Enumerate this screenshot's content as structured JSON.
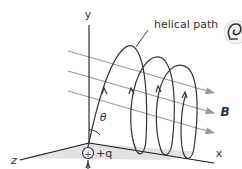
{
  "diagram": {
    "type": "physics-helical-motion",
    "labels": {
      "y_axis": "y",
      "x_axis": "x",
      "z_axis": "z",
      "angle": "θ",
      "charge": "+q",
      "charge_symbol": "+",
      "field": "B",
      "path": "helical path"
    },
    "colors": {
      "axes": "#1a1a1a",
      "field_lines": "#999999",
      "helix": "#333333",
      "plane": "#dcdcdc",
      "text": "#333333"
    },
    "icon": "spiral-icon"
  }
}
